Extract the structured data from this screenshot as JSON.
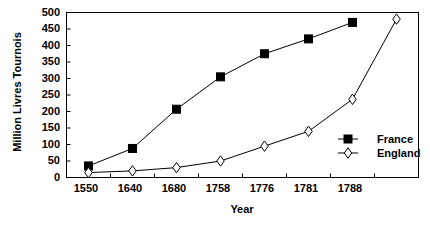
{
  "chart_data": {
    "type": "line",
    "title": "",
    "xlabel": "Year",
    "ylabel": "Million Livres Tournois",
    "categories": [
      "1550",
      "1640",
      "1680",
      "1758",
      "1776",
      "1781",
      "1788",
      ""
    ],
    "ylim": [
      0,
      500
    ],
    "ytick_values": [
      0,
      50,
      100,
      150,
      200,
      250,
      300,
      350,
      400,
      450,
      500
    ],
    "ytick_labels": [
      "0",
      "50",
      "100",
      "150",
      "200",
      "250",
      "300",
      "350",
      "400",
      "450",
      "500"
    ],
    "grid": false,
    "legend_position": "inside-right",
    "series": [
      {
        "name": "France",
        "marker": "filled-square",
        "color": "#000000",
        "values": [
          35,
          88,
          207,
          305,
          375,
          420,
          470,
          null
        ]
      },
      {
        "name": "England",
        "marker": "open-diamond",
        "color": "#000000",
        "values": [
          15,
          20,
          30,
          50,
          95,
          140,
          237,
          480
        ]
      }
    ]
  },
  "legend": {
    "entries": [
      {
        "label": "France"
      },
      {
        "label": "England"
      }
    ]
  }
}
